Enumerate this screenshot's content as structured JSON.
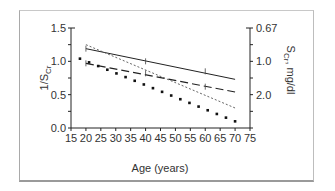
{
  "chart_data": {
    "type": "line",
    "title": "",
    "xlabel": "Age (years)",
    "ylabel": "1/S_Cr",
    "ylabel_right": "S_Cr, mg/dl",
    "xlim": [
      15,
      75
    ],
    "ylim": [
      0.0,
      1.5
    ],
    "x_ticks": [
      15,
      20,
      25,
      30,
      35,
      40,
      45,
      50,
      55,
      60,
      65,
      70,
      75
    ],
    "y_ticks": [
      0.0,
      0.5,
      1.0,
      1.5
    ],
    "y_tick_labels": [
      "0.0",
      "0.5",
      "1.0",
      "1.5"
    ],
    "y_right_ticks": [
      {
        "at": 1.5,
        "label": "0.67"
      },
      {
        "at": 1.0,
        "label": "1.0"
      },
      {
        "at": 0.5,
        "label": "2.0"
      }
    ],
    "grid": false,
    "legend": null,
    "series": [
      {
        "name": "solid line",
        "style": "solid",
        "x": [
          20,
          70
        ],
        "values": [
          1.19,
          0.73
        ]
      },
      {
        "name": "long-dash line",
        "style": "long-dash",
        "x": [
          20,
          70
        ],
        "values": [
          0.97,
          0.54
        ]
      },
      {
        "name": "short-dash line",
        "style": "short-dash",
        "x": [
          20,
          70
        ],
        "values": [
          1.25,
          0.3
        ]
      },
      {
        "name": "dotted line",
        "style": "dots",
        "x": [
          18,
          70
        ],
        "values": [
          1.04,
          0.1
        ]
      }
    ]
  },
  "labels": {
    "x_title": "Age (years)",
    "y_left_title": "1/S",
    "y_left_sub": "Cr",
    "y_right_title_s": "S",
    "y_right_sub": "Cr",
    "y_right_unit": ", mg/dl"
  }
}
